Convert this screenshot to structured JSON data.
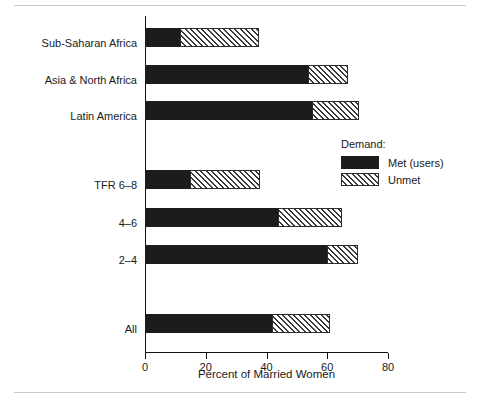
{
  "chart_data": {
    "type": "bar",
    "orientation": "horizontal",
    "stacked": true,
    "title": "",
    "xlabel": "Percent of Married Women",
    "ylabel": "",
    "xlim": [
      0,
      80
    ],
    "xticks": [
      0,
      20,
      40,
      60,
      80
    ],
    "xtick_labels": [
      "0",
      "20",
      "40",
      "60",
      "80"
    ],
    "grid": false,
    "legend_position": "right-middle",
    "legend_title": "Demand:",
    "categories": [
      "Sub-Saharan Africa",
      "Asia & North Africa",
      "Latin America",
      "TFR 6–8",
      "4–6",
      "2–4",
      "All"
    ],
    "series": [
      {
        "name": "Met (users)",
        "color": "#1c1c1c",
        "fill": "solid",
        "values": [
          11.5,
          53.6,
          55.0,
          14.8,
          43.8,
          59.9,
          41.8
        ]
      },
      {
        "name": "Unmet",
        "color": "#2b2b2b",
        "fill": "hatched",
        "values": [
          26.0,
          13.2,
          15.4,
          23.0,
          21.0,
          10.1,
          19.0
        ]
      }
    ],
    "totals": [
      37.5,
      66.8,
      70.4,
      37.8,
      64.8,
      70.0,
      60.8
    ]
  },
  "legend": {
    "title": "Demand:",
    "items": [
      {
        "label": "Met (users)",
        "pattern": "solid"
      },
      {
        "label": "Unmet",
        "pattern": "hatch"
      }
    ]
  },
  "axis": {
    "x_title": "Percent of Married Women",
    "x_ticks": [
      "0",
      "20",
      "40",
      "60",
      "80"
    ]
  },
  "category_labels": [
    "Sub-Saharan Africa",
    "Asia & North Africa",
    "Latin America",
    "TFR 6–8",
    "4–6",
    "2–4",
    "All"
  ],
  "colors": {
    "met": "#1c1c1c",
    "unmet_outline": "#2b2b2b",
    "axis": "#111111",
    "page_rule": "#c9c9c9",
    "background": "#ffffff"
  }
}
